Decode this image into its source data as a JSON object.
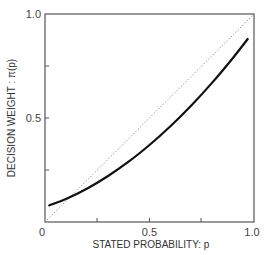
{
  "chart_data": {
    "type": "line",
    "title": "",
    "xlabel": "STATED PROBABILITY: p",
    "ylabel": "DECISION WEIGHT : π(p)",
    "xlim": [
      0,
      1.0
    ],
    "ylim": [
      0,
      1.0
    ],
    "x_tick_labels": [
      "0",
      "0.5",
      "1.0"
    ],
    "y_tick_labels": [
      "0.5",
      "1.0"
    ],
    "x_minor_ticks": [
      0.25,
      0.5,
      0.75
    ],
    "y_minor_ticks": [
      0.25,
      0.5,
      0.75
    ],
    "grid": false,
    "legend": null,
    "series": [
      {
        "name": "decision weight π(p)",
        "style": "solid",
        "color": "#111111",
        "x": [
          0.02,
          0.1,
          0.2,
          0.3,
          0.4,
          0.5,
          0.6,
          0.7,
          0.8,
          0.9,
          0.97
        ],
        "y": [
          0.08,
          0.11,
          0.16,
          0.22,
          0.29,
          0.37,
          0.46,
          0.56,
          0.67,
          0.79,
          0.88
        ]
      },
      {
        "name": "identity line π(p) = p",
        "style": "dotted",
        "color": "#777777",
        "x": [
          0,
          1.0
        ],
        "y": [
          0,
          1.0
        ]
      }
    ]
  },
  "labels": {
    "x_axis": "STATED PROBABILITY: p",
    "y_axis": "DECISION WEIGHT : π(p)",
    "x_tick_0": "0",
    "x_tick_05": "0.5",
    "x_tick_1": "1.0",
    "y_tick_05": "0.5",
    "y_tick_1": "1.0"
  }
}
